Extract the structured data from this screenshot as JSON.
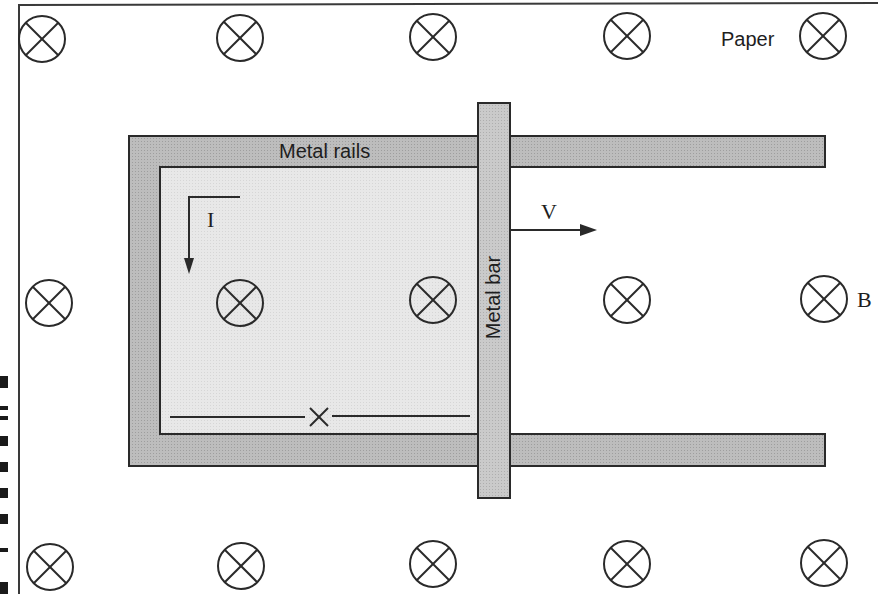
{
  "diagram": {
    "labels": {
      "paper": "Paper",
      "rails": "Metal rails",
      "bar": "Metal bar",
      "current": "I",
      "velocity": "V",
      "field": "B"
    },
    "field_direction": "into the page",
    "field_symbol": "circled-x",
    "field_markers": [
      {
        "row": "top",
        "x": 42,
        "y": 39
      },
      {
        "row": "top",
        "x": 240,
        "y": 38
      },
      {
        "row": "top",
        "x": 433,
        "y": 37
      },
      {
        "row": "top",
        "x": 627,
        "y": 36
      },
      {
        "row": "top",
        "x": 823,
        "y": 36
      },
      {
        "row": "middle",
        "x": 49,
        "y": 303
      },
      {
        "row": "middle",
        "x": 240,
        "y": 303
      },
      {
        "row": "middle",
        "x": 433,
        "y": 300
      },
      {
        "row": "middle",
        "x": 627,
        "y": 300
      },
      {
        "row": "middle",
        "x": 824,
        "y": 299
      },
      {
        "row": "bottom",
        "x": 50,
        "y": 567
      },
      {
        "row": "bottom",
        "x": 241,
        "y": 566
      },
      {
        "row": "bottom",
        "x": 433,
        "y": 564
      },
      {
        "row": "bottom",
        "x": 627,
        "y": 564
      },
      {
        "row": "bottom",
        "x": 824,
        "y": 563
      }
    ],
    "wire_crossing_symbol": "x",
    "colors": {
      "line": "#2a2a2a",
      "rail_fill": "#b8b8b8",
      "bar_fill": "#c6c6c6",
      "loop_interior": "#e6e6e6",
      "background": "#ffffff"
    }
  }
}
